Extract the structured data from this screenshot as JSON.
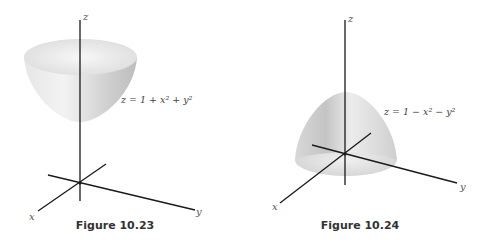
{
  "figures": [
    {
      "caption": "Figure 10.23",
      "equation": "z = 1 + x² + y²",
      "surface": "paraboloid opening upward",
      "axes": {
        "x": "x",
        "y": "y",
        "z": "z"
      }
    },
    {
      "caption": "Figure 10.24",
      "equation": "z = 1 − x² − y²",
      "surface": "paraboloid opening downward",
      "axes": {
        "x": "x",
        "y": "y",
        "z": "z"
      }
    }
  ],
  "colors": {
    "axis": "#1a1a1a",
    "surface_light": "#f2f2f2",
    "surface_dark": "#bdbdbd"
  }
}
